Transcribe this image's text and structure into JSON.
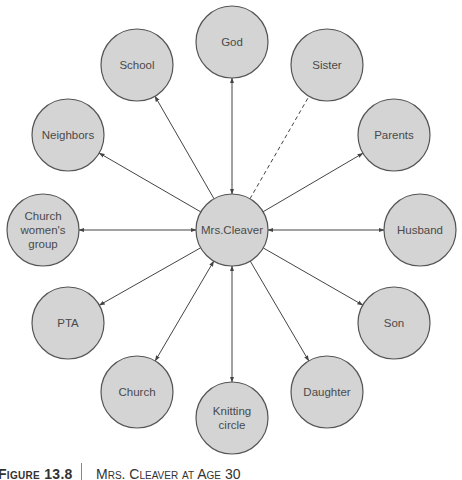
{
  "diagram": {
    "type": "ecomap",
    "center": {
      "id": "center",
      "label": "Mrs.Cleaver",
      "x": 232,
      "y": 230
    },
    "node_radius": 36,
    "colors": {
      "node_fill": "#d4d4d4",
      "node_stroke": "#555555",
      "edge": "#444444",
      "text": "#4a4a4a"
    },
    "nodes": [
      {
        "id": "god",
        "lines": [
          "God"
        ],
        "x": 232,
        "y": 42,
        "edge": "both"
      },
      {
        "id": "school",
        "lines": [
          "School"
        ],
        "x": 137,
        "y": 65,
        "edge": "to-node"
      },
      {
        "id": "sister",
        "lines": [
          "Sister"
        ],
        "x": 327,
        "y": 65,
        "edge": "dashed"
      },
      {
        "id": "neighbors",
        "lines": [
          "Neighbors"
        ],
        "x": 68,
        "y": 135,
        "edge": "to-node"
      },
      {
        "id": "parents",
        "lines": [
          "Parents"
        ],
        "x": 394,
        "y": 135,
        "edge": "to-node"
      },
      {
        "id": "church-womens-group",
        "lines": [
          "Church",
          "women's",
          "group"
        ],
        "x": 43,
        "y": 230,
        "edge": "both"
      },
      {
        "id": "husband",
        "lines": [
          "Husband"
        ],
        "x": 420,
        "y": 230,
        "edge": "both"
      },
      {
        "id": "pta",
        "lines": [
          "PTA"
        ],
        "x": 68,
        "y": 323,
        "edge": "to-node"
      },
      {
        "id": "son",
        "lines": [
          "Son"
        ],
        "x": 394,
        "y": 323,
        "edge": "to-node"
      },
      {
        "id": "church",
        "lines": [
          "Church"
        ],
        "x": 137,
        "y": 392,
        "edge": "both"
      },
      {
        "id": "daughter",
        "lines": [
          "Daughter"
        ],
        "x": 327,
        "y": 392,
        "edge": "to-node"
      },
      {
        "id": "knitting-circle",
        "lines": [
          "Knitting",
          "circle"
        ],
        "x": 232,
        "y": 418,
        "edge": "both"
      }
    ]
  },
  "caption": {
    "figure_number": "Figure 13.8",
    "title": "Mrs. Cleaver at Age 30"
  }
}
